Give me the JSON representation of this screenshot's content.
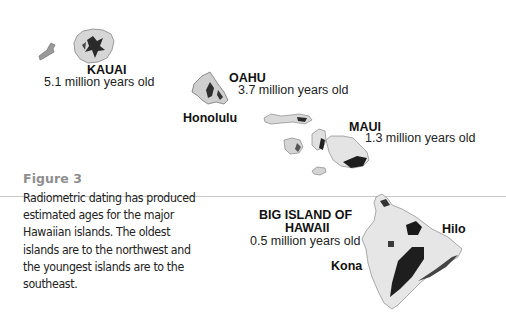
{
  "figure": {
    "label": "Figure 3",
    "caption_lines": [
      "Radiometric dating has produced",
      "estimated ages for the major",
      "Hawaiian islands.  The oldest",
      "islands are to the northwest and",
      "the youngest islands are to the",
      "southeast."
    ]
  },
  "islands": [
    {
      "name": "KAUAI",
      "age": "5.1 million years old"
    },
    {
      "name": "OAHU",
      "age": "3.7 million years old",
      "city": "Honolulu"
    },
    {
      "name": "MAUI",
      "age": "1.3 million years old"
    },
    {
      "name_line1": "BIG ISLAND OF",
      "name_line2": "HAWAII",
      "age": "0.5 million years old",
      "cities": [
        "Hilo",
        "Kona"
      ]
    }
  ]
}
